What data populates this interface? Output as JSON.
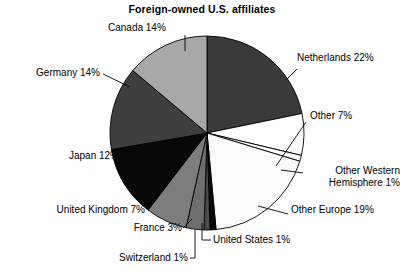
{
  "chart_data": {
    "type": "pie",
    "title": "Foreign-owned U.S. affiliates",
    "xlabel": "",
    "ylabel": "",
    "legend_position": "none",
    "grid": false,
    "unit": "%",
    "categories": [
      "Netherlands",
      "Other",
      "Other Western Hemisphere",
      "Other Europe",
      "United States",
      "Switzerland",
      "France",
      "United Kingdom",
      "Japan",
      "Germany",
      "Canada"
    ],
    "values": [
      22,
      7,
      1,
      19,
      1,
      1,
      3,
      7,
      12,
      14,
      14
    ],
    "slices": [
      {
        "label": "Netherlands 22%",
        "name": "Netherlands",
        "value": 22,
        "color": "#3a3a3a"
      },
      {
        "label": "Other 7%",
        "name": "Other",
        "value": 7,
        "color": "#ffffff"
      },
      {
        "label": "Other Western Hemisphere 1%",
        "name": "Other Western Hemisphere",
        "value": 1,
        "color": "#ffffff"
      },
      {
        "label": "Other Europe 19%",
        "name": "Other Europe",
        "value": 19,
        "color": "#fafafa"
      },
      {
        "label": "United States 1%",
        "name": "United States",
        "value": 1,
        "color": "#0a0a0a"
      },
      {
        "label": "Switzerland 1%",
        "name": "Switzerland",
        "value": 1,
        "color": "#4a4a4a"
      },
      {
        "label": "France 3%",
        "name": "France",
        "value": 3,
        "color": "#6e6e6e"
      },
      {
        "label": "United Kingdom 7%",
        "name": "United Kingdom",
        "value": 7,
        "color": "#7d7d7d"
      },
      {
        "label": "Japan 12%",
        "name": "Japan",
        "value": 12,
        "color": "#070707"
      },
      {
        "label": "Germany 14%",
        "name": "Germany",
        "value": 14,
        "color": "#3f3f3f"
      },
      {
        "label": "Canada 14%",
        "name": "Canada",
        "value": 14,
        "color": "#a8a8a8"
      }
    ]
  },
  "labels": {
    "canada": "Canada 14%",
    "netherlands": "Netherlands 22%",
    "germany": "Germany 14%",
    "other": "Other 7%",
    "other_western_1": "Other Western",
    "other_western_2": "Hemisphere 1%",
    "other_europe": "Other Europe 19%",
    "japan": "Japan 12%",
    "united_kingdom": "United Kingdom 7%",
    "france": "France 3%",
    "switzerland": "Switzerland 1%",
    "united_states": "United States 1%"
  }
}
